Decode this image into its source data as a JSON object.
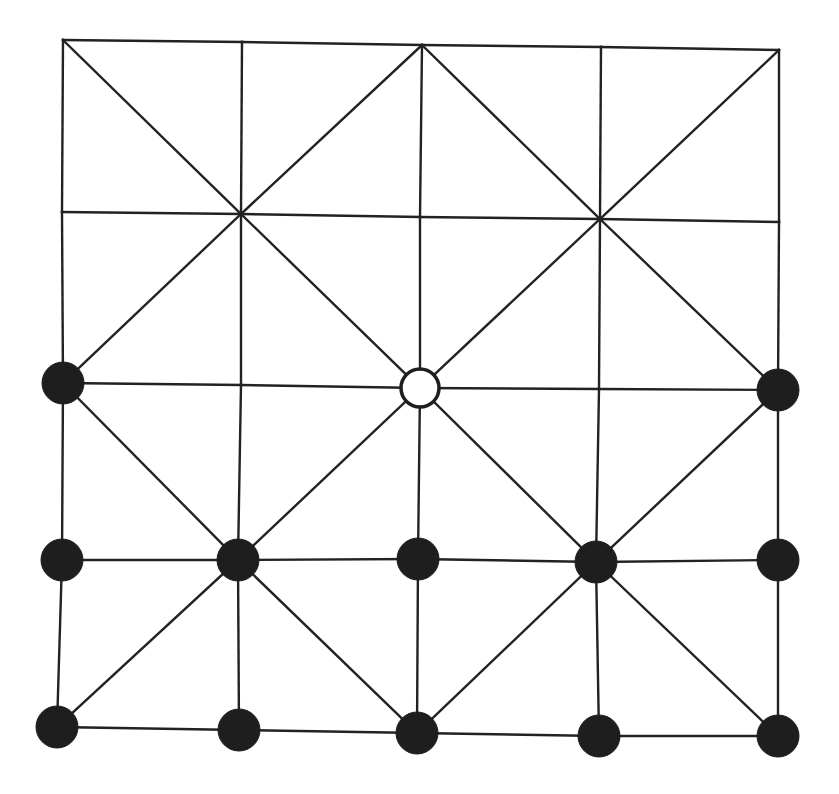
{
  "board": {
    "rows": 5,
    "cols": 5,
    "line_color": "#222222",
    "nodes": [
      [
        [
          63,
          40
        ],
        [
          242,
          42
        ],
        [
          422,
          45
        ],
        [
          601,
          47
        ],
        [
          779,
          50
        ]
      ],
      [
        [
          62,
          212
        ],
        [
          241,
          214
        ],
        [
          420,
          217
        ],
        [
          600,
          219
        ],
        [
          779,
          222
        ]
      ],
      [
        [
          63,
          383
        ],
        [
          241,
          385
        ],
        [
          420,
          388
        ],
        [
          599,
          389
        ],
        [
          778,
          390
        ]
      ],
      [
        [
          62,
          560
        ],
        [
          238,
          560
        ],
        [
          418,
          559
        ],
        [
          596,
          562
        ],
        [
          778,
          560
        ]
      ],
      [
        [
          57,
          727
        ],
        [
          239,
          730
        ],
        [
          417,
          733
        ],
        [
          599,
          736
        ],
        [
          778,
          736
        ]
      ]
    ],
    "diagonal_rule": "alquerque-even-nodes"
  },
  "pieces": {
    "black_color": "#1e1e1e",
    "white_color": "#ffffff",
    "radius": 21,
    "black_count": 14,
    "white_count": 1,
    "placements": [
      {
        "row": 2,
        "col": 0,
        "color": "black"
      },
      {
        "row": 2,
        "col": 2,
        "color": "white"
      },
      {
        "row": 2,
        "col": 4,
        "color": "black"
      },
      {
        "row": 3,
        "col": 0,
        "color": "black"
      },
      {
        "row": 3,
        "col": 1,
        "color": "black"
      },
      {
        "row": 3,
        "col": 2,
        "color": "black"
      },
      {
        "row": 3,
        "col": 3,
        "color": "black"
      },
      {
        "row": 3,
        "col": 4,
        "color": "black"
      },
      {
        "row": 4,
        "col": 0,
        "color": "black"
      },
      {
        "row": 4,
        "col": 1,
        "color": "black"
      },
      {
        "row": 4,
        "col": 2,
        "color": "black"
      },
      {
        "row": 4,
        "col": 3,
        "color": "black"
      },
      {
        "row": 4,
        "col": 4,
        "color": "black"
      }
    ]
  }
}
